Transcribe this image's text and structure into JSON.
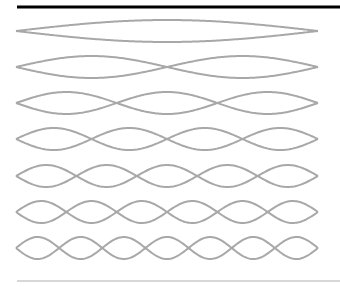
{
  "diagram": {
    "type": "standing-wave-harmonics",
    "harmonics": [
      1,
      2,
      3,
      4,
      5,
      6,
      7
    ],
    "string_left_x": 16,
    "string_right_x": 318,
    "row_centers_y": [
      31,
      67,
      103,
      139,
      176,
      212,
      248
    ],
    "amplitude": 11,
    "wave_color": "#a8a8a8",
    "top_rule_color": "#000000",
    "bottom_rule_color": "#b0b0b0"
  }
}
